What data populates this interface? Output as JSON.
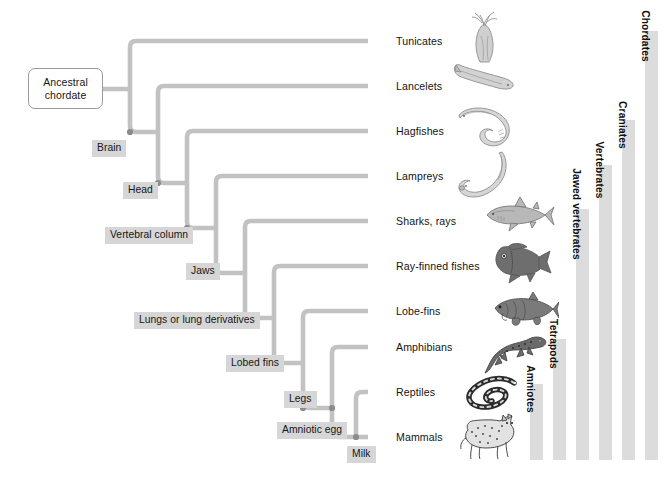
{
  "figure": {
    "root": {
      "label": "Ancestral\nchordate",
      "line1": "Ancestral",
      "line2": "chordate"
    },
    "branch_color": "#c2c2c2",
    "node_dot_color": "#8c8c8c",
    "label_bg_color": "#d6d6d6",
    "clade_bar_color": "#dcdcdc",
    "background_color": "#ffffff"
  },
  "derived_characters": [
    {
      "id": "brain",
      "label": "Brain"
    },
    {
      "id": "head",
      "label": "Head"
    },
    {
      "id": "vertebral",
      "label": "Vertebral column"
    },
    {
      "id": "jaws",
      "label": "Jaws"
    },
    {
      "id": "lungs",
      "label": "Lungs or lung derivatives"
    },
    {
      "id": "lobedfins",
      "label": "Lobed fins"
    },
    {
      "id": "legs",
      "label": "Legs"
    },
    {
      "id": "amniotic",
      "label": "Amniotic egg"
    },
    {
      "id": "milk",
      "label": "Milk"
    }
  ],
  "taxa": [
    {
      "id": "tunicates",
      "label": "Tunicates",
      "icon": "tunicate-illustration"
    },
    {
      "id": "lancelets",
      "label": "Lancelets",
      "icon": "lancelet-illustration"
    },
    {
      "id": "hagfishes",
      "label": "Hagfishes",
      "icon": "hagfish-illustration"
    },
    {
      "id": "lampreys",
      "label": "Lampreys",
      "icon": "lamprey-illustration"
    },
    {
      "id": "sharksrays",
      "label": "Sharks, rays",
      "icon": "shark-illustration"
    },
    {
      "id": "rayfinned",
      "label": "Ray-finned fishes",
      "icon": "rayfinned-fish-illustration"
    },
    {
      "id": "lobefins",
      "label": "Lobe-fins",
      "icon": "lobefin-illustration"
    },
    {
      "id": "amphibians",
      "label": "Amphibians",
      "icon": "salamander-illustration"
    },
    {
      "id": "reptiles",
      "label": "Reptiles",
      "icon": "snake-illustration"
    },
    {
      "id": "mammals",
      "label": "Mammals",
      "icon": "cat-illustration"
    }
  ],
  "clades": [
    {
      "id": "chordates",
      "label": "Chordates"
    },
    {
      "id": "craniates",
      "label": "Craniates"
    },
    {
      "id": "vertebrates",
      "label": "Vertebrates"
    },
    {
      "id": "jawed_vertebrates",
      "label": "Jawed vertebrates"
    },
    {
      "id": "tetrapods",
      "label": "Tetrapods"
    },
    {
      "id": "amniotes",
      "label": "Amniotes"
    }
  ]
}
